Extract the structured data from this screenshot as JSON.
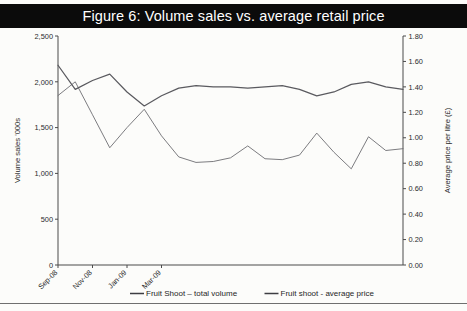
{
  "figure": {
    "title": "Figure 6: Volume sales vs. average retail price"
  },
  "chart_data": {
    "type": "line",
    "title": "Figure 6: Volume sales vs. average retail price",
    "xlabel": "",
    "ylabel": "Volume sales '000s",
    "y2label": "Average price per litre (£)",
    "grid": false,
    "legend_position": "bottom",
    "x_tick_labels": [
      "Sep-08",
      "Nov-08",
      "Jan-09",
      "Mar-09"
    ],
    "x_tick_index": [
      0,
      2,
      4,
      6
    ],
    "ylim": [
      0,
      2500
    ],
    "y_ticks": [
      0,
      500,
      1000,
      1500,
      2000,
      2500
    ],
    "y_tick_labels": [
      "0",
      "500",
      "1,000",
      "1,500",
      "2,000",
      "2,500"
    ],
    "y2lim": [
      0.0,
      1.8
    ],
    "y2_ticks": [
      0.0,
      0.2,
      0.4,
      0.6,
      0.8,
      1.0,
      1.2,
      1.4,
      1.6,
      1.8
    ],
    "y2_tick_labels": [
      "0.00",
      "0.20",
      "0.40",
      "0.60",
      "0.80",
      "1.00",
      "1.20",
      "1.40",
      "1.60",
      "1.80"
    ],
    "x": [
      0,
      0.35,
      0.7,
      1.05,
      1.4,
      1.75,
      2.1,
      2.45,
      2.8,
      3.15,
      3.5,
      3.85,
      4.2,
      4.55,
      4.9,
      5.25,
      5.6,
      5.95,
      6.3,
      6.65,
      7.0
    ],
    "series": [
      {
        "name": "Fruit Shoot – total volume",
        "axis": "left",
        "units": "'000s",
        "values": [
          1850,
          2000,
          1640,
          1280,
          1500,
          1700,
          1410,
          1180,
          1120,
          1130,
          1170,
          1300,
          1160,
          1150,
          1200,
          1440,
          1230,
          1050,
          1400,
          1250,
          1270
        ]
      },
      {
        "name": "Fruit shoot - average price",
        "axis": "right",
        "units": "£ per litre",
        "values": [
          1.57,
          1.38,
          1.45,
          1.5,
          1.36,
          1.25,
          1.33,
          1.39,
          1.41,
          1.4,
          1.4,
          1.39,
          1.4,
          1.41,
          1.38,
          1.33,
          1.36,
          1.42,
          1.44,
          1.4,
          1.38
        ]
      }
    ],
    "legend": [
      "Fruit Shoot – total volume",
      "Fruit shoot - average price"
    ]
  }
}
